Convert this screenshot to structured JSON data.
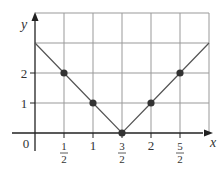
{
  "chart_data": {
    "type": "line",
    "title": "",
    "xlabel": "x",
    "ylabel": "y",
    "function": "y = |2x - 3|",
    "x": [
      0,
      0.5,
      1,
      1.5,
      2,
      2.5,
      3
    ],
    "y": [
      3,
      2,
      1,
      0,
      1,
      2,
      3
    ],
    "points_marked": [
      {
        "x": 0.5,
        "y": 2
      },
      {
        "x": 1,
        "y": 1
      },
      {
        "x": 1.5,
        "y": 0
      },
      {
        "x": 2,
        "y": 1
      },
      {
        "x": 2.5,
        "y": 2
      }
    ],
    "x_ticks": [
      {
        "value": 0.5,
        "label_num": "1",
        "label_den": "2"
      },
      {
        "value": 1,
        "label": "1"
      },
      {
        "value": 1.5,
        "label_num": "3",
        "label_den": "2"
      },
      {
        "value": 2,
        "label": "2"
      },
      {
        "value": 2.5,
        "label_num": "5",
        "label_den": "2"
      }
    ],
    "y_ticks": [
      {
        "value": 1,
        "label": "1"
      },
      {
        "value": 2,
        "label": "2"
      }
    ],
    "origin_label": "0",
    "xlim": [
      0,
      3
    ],
    "ylim": [
      0,
      3
    ],
    "grid": true,
    "colors": {
      "grid": "#999999",
      "line": "#555555",
      "axis": "#222222",
      "point": "#333333"
    }
  }
}
